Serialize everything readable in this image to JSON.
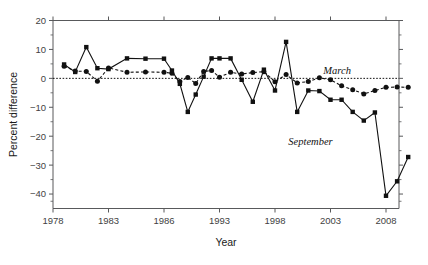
{
  "chart_data": {
    "type": "line",
    "title": "",
    "xlabel": "Year",
    "ylabel": "Percent difference",
    "xlim": [
      1978,
      2010
    ],
    "ylim": [
      -45,
      20
    ],
    "yticks": [
      20,
      10,
      0,
      -10,
      -20,
      -30,
      -40
    ],
    "ytick_labels": [
      "20",
      "10",
      "0",
      "-10",
      "-20",
      "-30",
      "-40"
    ],
    "xticks": [
      1978,
      1983,
      1986,
      1993,
      1998,
      2003,
      2008
    ],
    "xtick_labels": [
      "1978",
      "1983",
      "1986",
      "1993",
      "1998",
      "2003",
      "2008"
    ],
    "grid": false,
    "zero_reference_line": 0,
    "legend_position": "inline-annotation",
    "annotations": [
      {
        "text": "March",
        "x": 2003.6,
        "y": 1.6
      },
      {
        "text": "September",
        "x": 2001.2,
        "y": -23.0
      }
    ],
    "x": [
      1979,
      1980,
      1981,
      1982,
      1983,
      1984,
      1985,
      1986,
      1987,
      1988,
      1989,
      1990,
      1991,
      1992,
      1993,
      1994,
      1995,
      1996,
      1997,
      1998,
      1999,
      2000,
      2001,
      2002,
      2003,
      2004,
      2005,
      2006,
      2007,
      2008,
      2009,
      2010
    ],
    "series": [
      {
        "name": "March",
        "marker": "circle",
        "linestyle": "dashed",
        "values": [
          4.2,
          2.5,
          2.4,
          -1.0,
          3.6,
          2.1,
          2.2,
          2.1,
          1.8,
          -1.1,
          0.3,
          -1.8,
          2.4,
          2.7,
          0.4,
          2.1,
          1.5,
          2.0,
          2.3,
          -1.2,
          1.3,
          -1.6,
          -1.1,
          0.2,
          -0.5,
          -2.6,
          -3.9,
          -5.4,
          -4.2,
          -3.1,
          -3.0,
          -3.1
        ]
      },
      {
        "name": "September",
        "marker": "square",
        "linestyle": "solid",
        "values": [
          4.8,
          2.2,
          10.8,
          3.5,
          3.2,
          6.9,
          6.8,
          6.8,
          2.7,
          -1.9,
          -11.6,
          -5.6,
          0.6,
          6.9,
          6.9,
          6.9,
          -0.5,
          -8.1,
          3.0,
          -4.2,
          12.6,
          -11.6,
          -4.2,
          -4.4,
          -7.4,
          -7.4,
          -11.6,
          -14.6,
          -11.8,
          -40.6,
          -35.6,
          -27.2
        ]
      }
    ]
  }
}
